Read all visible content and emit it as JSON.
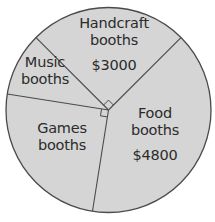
{
  "chart_data": {
    "type": "pie",
    "title": "",
    "total": 12000,
    "slices": [
      {
        "name": "Handcraft booths",
        "line1": "Handcraft",
        "line2": "booths",
        "value": 3000,
        "value_label": "$3000",
        "percent": 25,
        "degrees": 90,
        "right_angle_marker": true
      },
      {
        "name": "Food booths",
        "line1": "Food",
        "line2": "booths",
        "value": 4800,
        "value_label": "$4800",
        "percent": 40,
        "degrees": 144,
        "right_angle_marker": false
      },
      {
        "name": "Games booths",
        "line1": "Games",
        "line2": "booths",
        "value": 3000,
        "value_label": "",
        "percent": 25,
        "degrees": 90,
        "right_angle_marker": true
      },
      {
        "name": "Music booths",
        "line1": "Music",
        "line2": "booths",
        "value": 1200,
        "value_label": "",
        "percent": 10,
        "degrees": 36,
        "right_angle_marker": false
      }
    ],
    "boundary_angles_deg": [
      45,
      135,
      171,
      261
    ],
    "colors": {
      "fill": "#d5d5d5",
      "stroke": "#4a4a4a",
      "text": "#2b2b2b"
    },
    "legend": "none (labels inside slices)"
  },
  "labels": {
    "handcraft": {
      "line1": "Handcraft",
      "line2": "booths",
      "value": "$3000"
    },
    "food": {
      "line1": "Food",
      "line2": "booths",
      "value": "$4800"
    },
    "games": {
      "line1": "Games",
      "line2": "booths"
    },
    "music": {
      "line1": "Music",
      "line2": "booths"
    }
  }
}
